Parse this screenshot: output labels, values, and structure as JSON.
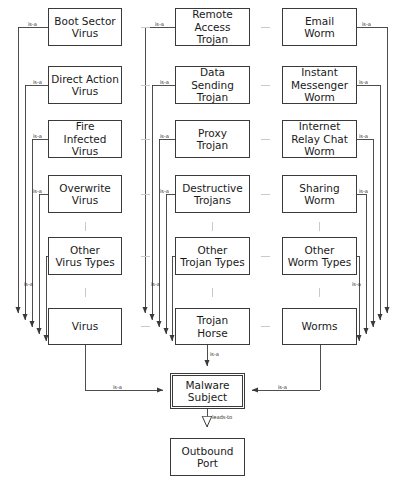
{
  "diagram": {
    "edge_label_isa": "is-a",
    "edge_label_leadsto": "leads-to",
    "columns": [
      {
        "id": "virus",
        "parent": "Virus",
        "children": [
          "Boot Sector\nVirus",
          "Direct Action\nVirus",
          "Fire\nInfected\nVirus",
          "Overwrite\nVirus",
          "Other\nVirus Types"
        ]
      },
      {
        "id": "trojan",
        "parent": "Trojan\nHorse",
        "children": [
          "Remote\nAccess\nTrojan",
          "Data\nSending\nTrojan",
          "Proxy\nTrojan",
          "Destructive\nTrojans",
          "Other\nTrojan Types"
        ]
      },
      {
        "id": "worm",
        "parent": "Worms",
        "children": [
          "Email\nWorm",
          "Instant\nMessenger\nWorm",
          "Internet\nRelay Chat\nWorm",
          "Sharing\nWorm",
          "Other\nWorm Types"
        ]
      }
    ],
    "subject": "Malware\nSubject",
    "outcome": "Outbound\nPort",
    "colors": {
      "stroke": "#3a3a3a",
      "text": "#1a1a1a",
      "separator": "#c9c9c9",
      "background": "#ffffff"
    }
  }
}
